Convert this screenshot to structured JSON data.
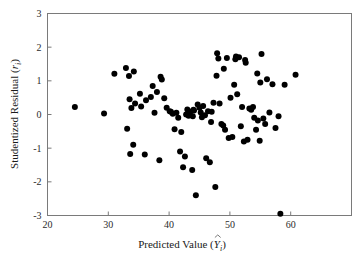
{
  "chart_data": {
    "type": "scatter",
    "title": "",
    "xlabel": "Predicted Value (Ŷi)",
    "ylabel": "Studentized Residual (ri)",
    "xlabel_main": "Predicted Value (",
    "xlabel_symbol": "Y",
    "xlabel_sub": "i",
    "xlabel_close": ")",
    "ylabel_main": "Studentized Residual (",
    "ylabel_symbol": "r",
    "ylabel_sub": "i",
    "ylabel_close": ")",
    "xlim": [
      20,
      70
    ],
    "ylim": [
      -3,
      3
    ],
    "xticks": [
      20,
      30,
      40,
      50,
      60
    ],
    "xtick_labels": [
      "20",
      "30",
      "40",
      "50",
      "60"
    ],
    "yticks": [
      -3,
      -2,
      -1,
      0,
      1,
      2,
      3
    ],
    "ytick_labels": [
      "-3",
      "-2",
      "-1",
      "0",
      "1",
      "2",
      "3"
    ],
    "grid": false,
    "legend": "none",
    "marker": "filled-circle",
    "marker_color": "#000000",
    "marker_size_px": 3.0,
    "n_points": 100,
    "x": [
      24.5,
      29.3,
      31.0,
      32.9,
      33.4,
      33.5,
      33.8,
      34.2,
      34.4,
      35.2,
      33.1,
      33.6,
      34.1,
      35.4,
      36.0,
      37.3,
      37.6,
      38.0,
      38.4,
      38.6,
      39.2,
      39.6,
      40.1,
      40.6,
      40.9,
      41.2,
      41.5,
      41.8,
      42.0,
      42.3,
      42.6,
      43.0,
      43.2,
      43.5,
      43.8,
      44.1,
      44.4,
      44.7,
      45.0,
      45.2,
      45.4,
      45.6,
      45.9,
      46.1,
      46.4,
      46.7,
      47.0,
      47.3,
      47.6,
      47.9,
      48.1,
      48.3,
      48.6,
      48.9,
      49.2,
      49.5,
      49.8,
      50.1,
      50.4,
      50.7,
      50.9,
      51.2,
      51.5,
      51.8,
      52.0,
      52.3,
      52.6,
      52.9,
      53.2,
      53.5,
      53.8,
      54.0,
      54.3,
      54.6,
      54.9,
      55.2,
      55.5,
      55.8,
      56.1,
      56.5,
      57.0,
      57.5,
      58.0,
      58.3,
      59.0,
      60.8,
      36.2,
      37.0,
      38.8,
      40.3,
      42.8,
      43.9,
      44.0,
      46.9,
      47.8,
      49.0,
      51.0,
      52.5,
      54.5,
      55.0
    ],
    "y": [
      0.22,
      0.03,
      1.21,
      1.38,
      1.14,
      0.45,
      0.19,
      1.28,
      0.33,
      0.62,
      -0.42,
      -1.17,
      -0.9,
      0.24,
      -1.19,
      0.85,
      0.05,
      0.67,
      -1.36,
      1.12,
      0.48,
      0.2,
      0.1,
      0.02,
      -0.44,
      0.05,
      -0.1,
      -1.1,
      -0.52,
      -1.57,
      -1.25,
      0.15,
      -0.04,
      0.08,
      -1.65,
      0.12,
      -2.4,
      0.3,
      0.2,
      0.06,
      -0.08,
      0.25,
      -0.02,
      -1.3,
      0.1,
      -1.42,
      0.08,
      0.35,
      -2.15,
      1.82,
      1.66,
      0.33,
      -0.28,
      -0.33,
      -0.45,
      1.68,
      -0.7,
      0.5,
      -0.67,
      0.88,
      1.64,
      0.6,
      1.7,
      -0.35,
      0.22,
      -0.8,
      1.54,
      -0.75,
      0.18,
      0.14,
      0.22,
      -0.1,
      -0.45,
      -0.18,
      -0.78,
      1.8,
      -0.12,
      -0.28,
      1.05,
      0.06,
      0.9,
      -0.4,
      -0.05,
      -2.95,
      0.88,
      1.18,
      0.42,
      0.52,
      1.04,
      0.08,
      0.0,
      -0.05,
      0.14,
      -0.22,
      1.15,
      1.36,
      1.72,
      1.62,
      1.22,
      0.95
    ]
  },
  "figure": {
    "background_color": "#ffffff",
    "frame_color": "#7a7a7a",
    "text_color": "#1a1a1a"
  }
}
